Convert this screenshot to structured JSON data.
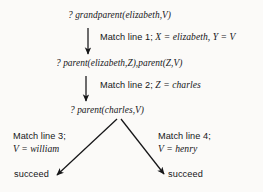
{
  "diagram": {
    "background_color": "#fbfaf8",
    "ink_color": "#161618",
    "nodes": [
      {
        "id": "goal-1",
        "text": "? grandparent(elizabeth,V)",
        "x": 68,
        "y": 10
      },
      {
        "id": "goal-2",
        "text": "? parent(elizabeth,Z),parent(Z,V)",
        "x": 56,
        "y": 58
      },
      {
        "id": "goal-3",
        "text": "? parent(charles,V)",
        "x": 70,
        "y": 105
      }
    ],
    "leaves": [
      {
        "id": "leaf-left",
        "text": "succeed",
        "x": 14,
        "y": 169
      },
      {
        "id": "leaf-right",
        "text": "succeed",
        "x": 168,
        "y": 169
      }
    ],
    "edge_labels": [
      {
        "id": "match-1",
        "rule": "Match line 1;",
        "bindings": "X = elizabeth, Y = V",
        "x": 100,
        "y": 31
      },
      {
        "id": "match-2",
        "rule": "Match line 2;",
        "bindings": "Z = charles",
        "x": 100,
        "y": 79
      },
      {
        "id": "match-3",
        "rule": "Match line 3;",
        "bindings": "V = william",
        "x": 13,
        "y": 130
      },
      {
        "id": "match-4",
        "rule": "Match line 4;",
        "bindings": "V = henry",
        "x": 158,
        "y": 130
      }
    ],
    "arrows": [
      {
        "id": "arrow-goal1-goal2",
        "x1": 88,
        "y1": 28,
        "x2": 88,
        "y2": 54
      },
      {
        "id": "arrow-goal2-goal3",
        "x1": 86,
        "y1": 76,
        "x2": 86,
        "y2": 101
      },
      {
        "id": "arrow-goal3-left-succeed",
        "x1": 117,
        "y1": 119,
        "x2": 57,
        "y2": 175
      },
      {
        "id": "arrow-goal3-right-succeed",
        "x1": 121,
        "y1": 119,
        "x2": 164,
        "y2": 174
      }
    ]
  }
}
